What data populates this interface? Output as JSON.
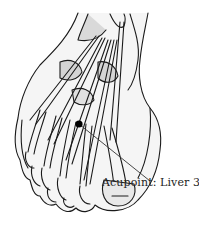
{
  "figure": {
    "label": "Acupoint: Liver 3",
    "point_marker": {
      "x": 79,
      "y": 124
    },
    "leader_line_end": {
      "x": 150,
      "y": 181
    },
    "colors": {
      "outline": "#1a1a1a",
      "shade": "#d4d4d4",
      "marker": "#000000"
    }
  }
}
